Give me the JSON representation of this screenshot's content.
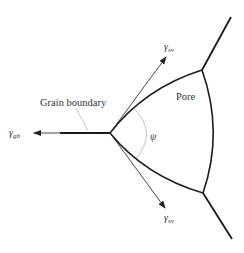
{
  "diagram": {
    "labels": {
      "grain_boundary": "Grain boundary",
      "pore": "Pore",
      "psi": "ψ",
      "gamma_gb_symbol": "γ",
      "gamma_gb_sub": "gb",
      "gamma_sv_upper_symbol": "γ",
      "gamma_sv_upper_sub": "sv",
      "gamma_sv_lower_symbol": "γ",
      "gamma_sv_lower_sub": "sv"
    },
    "colors": {
      "line": "#1a1a1a",
      "arrow": "#333333",
      "angle_arc": "#bbbbbb",
      "leader": "#aaaaaa",
      "text": "#333333"
    }
  }
}
